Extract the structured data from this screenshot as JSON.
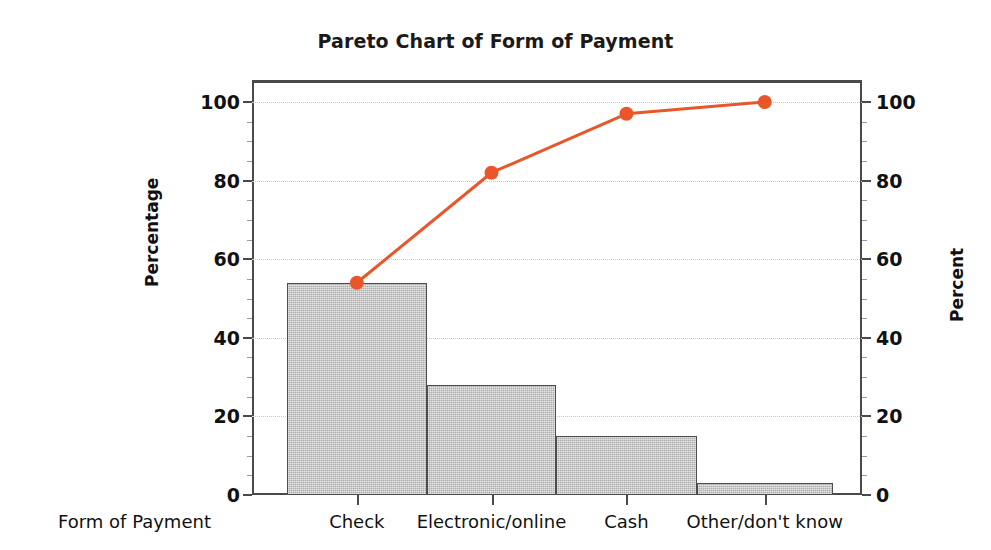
{
  "chart_data": {
    "type": "bar",
    "title": "Pareto Chart of Form of Payment",
    "xlabel": "Form of Payment",
    "ylabel": "Percentage",
    "y2label": "Percent",
    "categories": [
      "Check",
      "Electronic/online",
      "Cash",
      "Other/don't know"
    ],
    "values": [
      54,
      28,
      15,
      3
    ],
    "series": [
      {
        "name": "Percentage",
        "type": "bar",
        "values": [
          54,
          28,
          15,
          3
        ]
      },
      {
        "name": "Cumulative Percent",
        "type": "line",
        "values": [
          54,
          82,
          97,
          100
        ]
      }
    ],
    "ylim": [
      0,
      100
    ],
    "y2lim": [
      0,
      100
    ],
    "yticks": [
      0,
      20,
      40,
      60,
      80,
      100
    ],
    "y2ticks": [
      0,
      20,
      40,
      60,
      80,
      100
    ],
    "ytick_labels": [
      "0",
      "20",
      "40",
      "60",
      "80",
      "100"
    ],
    "y2tick_labels": [
      "0",
      "20",
      "40",
      "60",
      "80",
      "100"
    ],
    "grid": true,
    "legend": "none",
    "colors": {
      "bar_fill": "#BFBFBF",
      "bar_edge": "#4D4D4D",
      "line": "#E8562A",
      "marker": "#E8562A",
      "grid": "#C9C9C9",
      "axis": "#4A4A4A",
      "background": "#FFFFFF",
      "text": "#111111"
    },
    "bar_widths_ratio": [
      0.23,
      0.212,
      0.231,
      0.223
    ]
  }
}
